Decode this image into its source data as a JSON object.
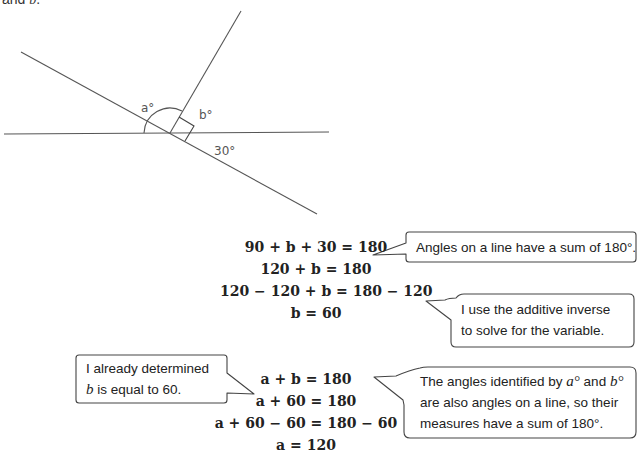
{
  "intro": {
    "text_prefix": "and ",
    "text_var": "b",
    "text_suffix": "."
  },
  "diagram": {
    "label_a": "a°",
    "label_b": "b°",
    "label_30": "30°",
    "right_angle_marker": true
  },
  "equations_b": [
    "90 + b + 30 = 180",
    "120 + b = 180",
    "120 − 120 + b = 180 − 120",
    "b = 60"
  ],
  "equations_a": [
    "a + b = 180",
    "a + 60 = 180",
    "a + 60 − 60 = 180 − 60",
    "a = 120"
  ],
  "callouts": {
    "angles_on_line": {
      "text": "Angles on a line have a sum of 180°."
    },
    "additive_inverse": {
      "line1": "I use the additive inverse",
      "line2": "to solve for the variable."
    },
    "already_determined": {
      "line1": "I already determined",
      "line2_var": "b",
      "line2_rest": " is equal to 60."
    },
    "angles_identified": {
      "line1_prefix": "The angles identified by ",
      "line1_var_a": "a°",
      "line1_mid": " and ",
      "line1_var_b": "b°",
      "line2": "are also angles on a line, so their",
      "line3": "measures have a sum of 180°."
    }
  }
}
